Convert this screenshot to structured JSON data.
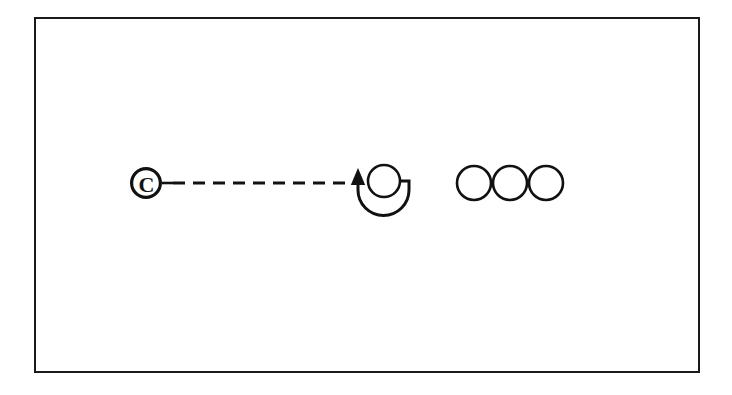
{
  "figure": {
    "background_color": "#ffffff",
    "ink_color": "#111111",
    "frame": {
      "name": "outer-border",
      "x": 34,
      "y": 17,
      "width": 666,
      "height": 356,
      "stroke_width": 2,
      "stroke_color": "#1a1a1a"
    },
    "nodes": [
      {
        "id": "copyright-node",
        "kind": "copyright-symbol",
        "label": "C",
        "cx": 146,
        "cy": 183,
        "outer_radius": 16,
        "ring_width": 3.2,
        "letter_size": 22,
        "stroke_color": "#111111"
      },
      {
        "id": "loop-node",
        "kind": "circle-with-loop-arrow",
        "label": "",
        "cx": 384,
        "cy": 181,
        "radius": 16,
        "stroke_width": 2.6,
        "stroke_color": "#111111"
      },
      {
        "id": "plain-node-1",
        "kind": "circle",
        "label": "",
        "cx": 474,
        "cy": 183,
        "radius": 17,
        "stroke_width": 2.6,
        "stroke_color": "#111111"
      },
      {
        "id": "plain-node-2",
        "kind": "circle",
        "label": "",
        "cx": 510,
        "cy": 183,
        "radius": 17,
        "stroke_width": 2.6,
        "stroke_color": "#111111"
      },
      {
        "id": "plain-node-3",
        "kind": "circle",
        "label": "",
        "cx": 546,
        "cy": 183,
        "radius": 17,
        "stroke_width": 2.6,
        "stroke_color": "#111111"
      }
    ],
    "connectors": [
      {
        "id": "copyright-stub",
        "kind": "solid-line",
        "x1": 162,
        "y1": 183,
        "x2": 172,
        "y2": 183,
        "stroke_width": 2.6,
        "stroke_color": "#111111"
      },
      {
        "id": "dashed-link",
        "kind": "dashed-line",
        "from": "copyright-node",
        "to": "loop-node",
        "x1": 172,
        "y1": 183,
        "x2": 345,
        "y2": 183,
        "stroke_width": 3,
        "dash_length": 12,
        "gap_length": 8,
        "stroke_color": "#111111"
      },
      {
        "id": "loop-arrow",
        "kind": "curved-arrow",
        "direction": "counterclockwise",
        "start_x": 409,
        "start_y": 181,
        "end_x": 358,
        "end_y": 180,
        "arrow_tip_x": 358,
        "arrow_tip_y": 170,
        "arrow_head_width": 14,
        "arrow_head_length": 17,
        "stroke_width": 3,
        "stroke_color": "#111111"
      }
    ]
  }
}
